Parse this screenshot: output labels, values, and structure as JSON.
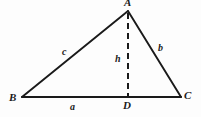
{
  "figure": {
    "background_color": "#fdfdfd",
    "stroke_color": "#1a1a1a",
    "width": 201,
    "height": 117
  },
  "vertices": {
    "A": {
      "label": "A",
      "x": 128,
      "y": 11
    },
    "B": {
      "label": "B",
      "x": 22,
      "y": 97
    },
    "C": {
      "label": "C",
      "x": 181,
      "y": 97
    },
    "D": {
      "label": "D",
      "x": 128,
      "y": 97
    }
  },
  "sides": {
    "a": {
      "label": "a",
      "from": "B",
      "to": "C"
    },
    "b": {
      "label": "b",
      "from": "A",
      "to": "C"
    },
    "c": {
      "label": "c",
      "from": "B",
      "to": "A"
    },
    "h": {
      "label": "h",
      "from": "A",
      "to": "D",
      "style": "dashed"
    }
  },
  "geometry": {
    "base_line": {
      "x1": 22,
      "y1": 97,
      "x2": 181,
      "y2": 97
    },
    "left_side": {
      "x1": 22,
      "y1": 97,
      "x2": 128,
      "y2": 11
    },
    "right_side": {
      "x1": 128,
      "y1": 11,
      "x2": 181,
      "y2": 97
    },
    "altitude": {
      "x1": 128,
      "y1": 13,
      "x2": 128,
      "y2": 97,
      "dash": "6 4"
    }
  }
}
